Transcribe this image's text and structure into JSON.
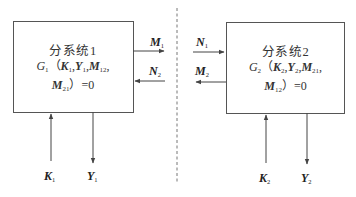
{
  "diagram": {
    "subsystem1": {
      "title": "分系统1",
      "equation": {
        "func": "G",
        "func_sub": "1",
        "open": "（",
        "args": [
          {
            "sym": "K",
            "sub": "1"
          },
          {
            "sym": "Y",
            "sub": "1"
          },
          {
            "sym": "M",
            "sub": "12"
          },
          {
            "sym": "M",
            "sub": "21"
          }
        ],
        "sep": ",",
        "close": "）=0"
      },
      "inputs_bottom": {
        "sym": "K",
        "sub": "1"
      },
      "outputs_bottom": {
        "sym": "Y",
        "sub": "1"
      },
      "output_right": {
        "sym": "M",
        "sub": "1"
      },
      "input_right": {
        "sym": "N",
        "sub": "2"
      }
    },
    "subsystem2": {
      "title": "分系统2",
      "equation": {
        "func": "G",
        "func_sub": "2",
        "open": "（",
        "args": [
          {
            "sym": "K",
            "sub": "2"
          },
          {
            "sym": "Y",
            "sub": "2"
          },
          {
            "sym": "M",
            "sub": "21"
          },
          {
            "sym": "M",
            "sub": "12"
          }
        ],
        "sep": ",",
        "close": "）=0"
      },
      "inputs_bottom": {
        "sym": "K",
        "sub": "2"
      },
      "outputs_bottom": {
        "sym": "Y",
        "sub": "2"
      },
      "input_left": {
        "sym": "N",
        "sub": "1"
      },
      "output_left": {
        "sym": "M",
        "sub": "2"
      }
    },
    "colors": {
      "line": "#555555",
      "text": "#222222",
      "divider": "#777777"
    }
  }
}
